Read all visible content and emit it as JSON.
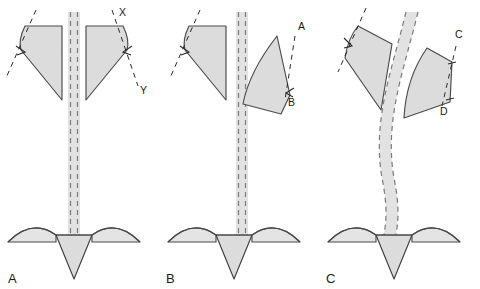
{
  "figure": {
    "width": 480,
    "height": 289,
    "background": "#ffffff",
    "colors": {
      "leaf_fill": "#dcdcdc",
      "leaf_stroke": "#4a4a4a",
      "band_fill": "#e2e2e2",
      "band_dash_stroke": "#7b7b7b",
      "guide_stroke": "#2a2a2a",
      "wing_fill": "#e4e4e4",
      "cone_fill": "#dcdcdc",
      "text": "#1a1a1a"
    }
  },
  "panels": [
    {
      "id": "A",
      "label": "A",
      "label_x": 8,
      "label_y": 283,
      "description": "Symmetric configuration: straight vertical central band, both lateral segments upright and mirrored.",
      "band": {
        "type": "straight",
        "x_left": 68,
        "x_right": 80,
        "y_top": 12,
        "y_bottom": 235
      },
      "point_labels": [
        {
          "text": "X",
          "x": 119,
          "y": 16
        },
        {
          "text": "Y",
          "x": 140,
          "y": 94
        }
      ]
    },
    {
      "id": "B",
      "label": "B",
      "label_x": 166,
      "label_y": 283,
      "description": "Straight vertical central band, right lateral segment rotated/tilted about its lower pivot.",
      "band": {
        "type": "straight",
        "x_left": 236,
        "x_right": 248,
        "y_top": 12,
        "y_bottom": 235
      },
      "point_labels": [
        {
          "text": "A",
          "x": 298,
          "y": 30
        },
        {
          "text": "B",
          "x": 288,
          "y": 106
        }
      ]
    },
    {
      "id": "C",
      "label": "C",
      "label_x": 326,
      "label_y": 283,
      "description": "Curved/deviated central band; both lateral segments tilted and displaced.",
      "band": {
        "type": "curved",
        "y_top": 12,
        "y_bottom": 235
      },
      "point_labels": [
        {
          "text": "C",
          "x": 455,
          "y": 38
        },
        {
          "text": "D",
          "x": 440,
          "y": 115
        }
      ]
    }
  ],
  "legend": {
    "panel_labels": [
      "A",
      "B",
      "C"
    ],
    "point_labels": [
      "X",
      "Y",
      "A",
      "B",
      "C",
      "D"
    ]
  }
}
